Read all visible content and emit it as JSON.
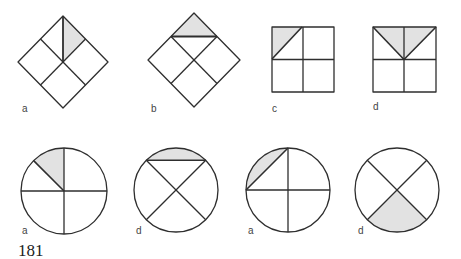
{
  "page_number": "181",
  "colors": {
    "line": "#2e2e2e",
    "shade": "#e2e2e2",
    "background": "#ffffff"
  },
  "figures": {
    "row1": [
      {
        "label": "a",
        "shape": "diamond",
        "shaded": "triangle between top vertex, center and midpoint of upper-right edge (1/8)"
      },
      {
        "label": "b",
        "shape": "diamond",
        "shaded": "top corner triangle cut by chord between upper edge midpoints (1/8)"
      },
      {
        "label": "c",
        "shape": "square",
        "shaded": "half of top-left quarter (1/8)"
      },
      {
        "label": "d",
        "shape": "square",
        "shaded": "V-shaped triangle from top corners to center (1/4)"
      }
    ],
    "row2": [
      {
        "label": "a",
        "shape": "circle",
        "shaded": "sector from 90deg to 135deg (1/8)"
      },
      {
        "label": "d",
        "shape": "circle",
        "shaded": "circular segment above chord at top"
      },
      {
        "label": "a",
        "shape": "circle",
        "shaded": "circular segment between left and top points"
      },
      {
        "label": "d",
        "shape": "circle",
        "shaded": "bottom quadrant between X diagonals (1/4)"
      }
    ]
  }
}
